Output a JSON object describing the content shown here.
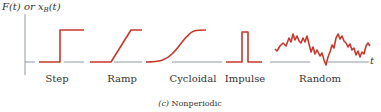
{
  "axes": {
    "y_label_main": "F(t) or x",
    "y_label_sub": "B",
    "y_label_tail": "(t)",
    "x_label": "t"
  },
  "signals": [
    {
      "id": "step",
      "label": "Step",
      "label_x": 57
    },
    {
      "id": "ramp",
      "label": "Ramp",
      "label_x": 122
    },
    {
      "id": "cycloidal",
      "label": "Cycloidal",
      "label_x": 193
    },
    {
      "id": "impulse",
      "label": "Impulse",
      "label_x": 245
    },
    {
      "id": "random",
      "label": "Random",
      "label_x": 320
    }
  ],
  "caption": {
    "prefix": "(c)",
    "text": "Nonperiodic"
  },
  "colors": {
    "signal": "#c8382a",
    "axis": "#8f98aa",
    "text": "#333333"
  }
}
